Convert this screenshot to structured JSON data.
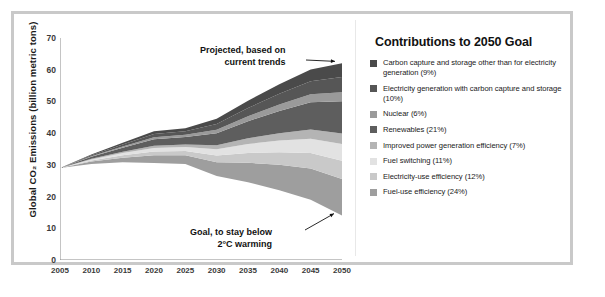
{
  "figure": {
    "frame_color": "#c9c9c9",
    "background": "#ffffff"
  },
  "legend": {
    "title": "Contributions to 2050 Goal",
    "items": [
      {
        "label": "Carbon capture and storage other than for electricity generation (9%)",
        "color": "#4a4a4a",
        "percent": 9
      },
      {
        "label": "Electricity generation with carbon capture and storage (10%)",
        "color": "#565656",
        "percent": 10
      },
      {
        "label": "Nuclear (6%)",
        "color": "#9a9a9a",
        "percent": 6
      },
      {
        "label": "Renewables (21%)",
        "color": "#5e5e5e",
        "percent": 21
      },
      {
        "label": "Improved power generation efficiency (7%)",
        "color": "#b4b4b4",
        "percent": 7
      },
      {
        "label": "Fuel switching (11%)",
        "color": "#e2e2e2",
        "percent": 11
      },
      {
        "label": "Electricity-use efficiency (12%)",
        "color": "#c9c9c9",
        "percent": 12
      },
      {
        "label": "Fuel-use efficiency (24%)",
        "color": "#9e9e9e",
        "percent": 24
      }
    ]
  },
  "annotations": {
    "top_line1": "Projected, based on",
    "top_line2": "current trends",
    "bottom_line1": "Goal, to stay below",
    "bottom_line2": "2°C warming"
  },
  "chart_data": {
    "type": "area",
    "title": "",
    "xlabel": "",
    "ylabel": "Global CO₂ Emissions (billion metric tons)",
    "xlim": [
      2005,
      2050
    ],
    "ylim": [
      0,
      70
    ],
    "grid": false,
    "legend_position": "right",
    "x": [
      2005,
      2010,
      2015,
      2020,
      2025,
      2030,
      2035,
      2040,
      2045,
      2050
    ],
    "xticks": [
      2005,
      2010,
      2015,
      2020,
      2025,
      2030,
      2035,
      2040,
      2045,
      2050
    ],
    "yticks": [
      0,
      10,
      20,
      30,
      40,
      50,
      60,
      70
    ],
    "baseline_name": "Projected, based on current trends",
    "baseline_values": [
      29,
      31.5,
      34.5,
      38.5,
      40.5,
      44.5,
      49,
      53.5,
      58,
      62
    ],
    "goal_name": "Goal, to stay below 2°C warming",
    "goal_values": [
      29,
      30.3,
      30.8,
      30.6,
      30.3,
      26.5,
      24.5,
      22,
      19,
      14
    ],
    "series": [
      {
        "name": "Carbon capture and storage other than for electricity generation",
        "color": "#4a4a4a",
        "values": [
          0,
          0.25,
          0.55,
          0.9,
          1.0,
          1.6,
          2.3,
          3.0,
          3.7,
          4.3
        ]
      },
      {
        "name": "Electricity generation with carbon capture and storage",
        "color": "#565656",
        "values": [
          0,
          0.3,
          0.6,
          1.0,
          1.1,
          1.8,
          2.6,
          3.4,
          4.1,
          4.8
        ]
      },
      {
        "name": "Nuclear",
        "color": "#9a9a9a",
        "values": [
          0,
          0.18,
          0.37,
          0.6,
          0.68,
          1.1,
          1.55,
          2.0,
          2.5,
          2.9
        ]
      },
      {
        "name": "Renewables",
        "color": "#5e5e5e",
        "values": [
          0,
          0.63,
          1.3,
          2.1,
          2.38,
          3.78,
          5.4,
          7.0,
          8.6,
          10.1
        ]
      },
      {
        "name": "Improved power generation efficiency",
        "color": "#b4b4b4",
        "values": [
          0,
          0.21,
          0.43,
          0.7,
          0.79,
          1.26,
          1.8,
          2.33,
          2.87,
          3.36
        ]
      },
      {
        "name": "Fuel switching",
        "color": "#e2e2e2",
        "values": [
          0,
          0.33,
          0.68,
          1.1,
          1.25,
          1.98,
          2.83,
          3.67,
          4.51,
          5.28
        ]
      },
      {
        "name": "Electricity-use efficiency",
        "color": "#c9c9c9",
        "values": [
          0,
          0.36,
          0.74,
          1.2,
          1.36,
          2.16,
          3.08,
          4.0,
          4.92,
          5.76
        ]
      },
      {
        "name": "Fuel-use efficiency",
        "color": "#9e9e9e",
        "values": [
          0,
          0.72,
          1.48,
          2.4,
          2.72,
          4.32,
          6.16,
          8.0,
          9.84,
          11.52
        ]
      }
    ]
  }
}
